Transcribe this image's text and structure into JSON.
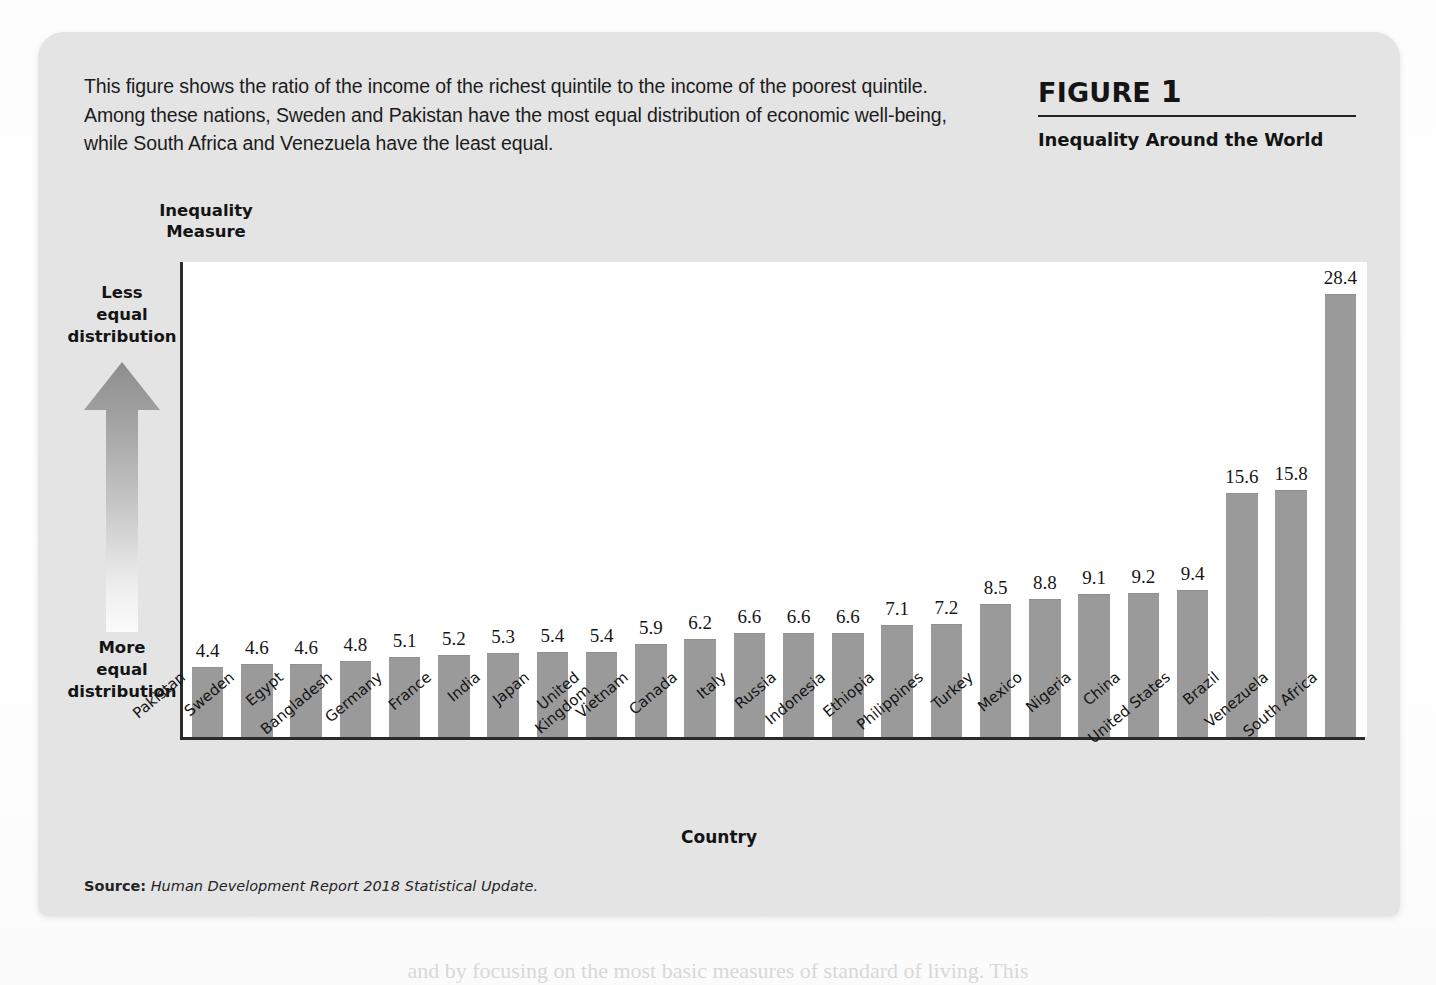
{
  "figure": {
    "intro_text": "This figure shows the ratio of the income of the richest quintile to the income of the poorest quintile. Among these nations, Sweden and Pakistan have the most equal distribution of economic well-being, while South Africa and Venezuela have the least equal.",
    "label_word": "FIGURE",
    "label_number": "1",
    "subtitle": "Inequality Around the World",
    "source_label": "Source:",
    "source_text": "Human Development Report 2018 Statistical Update.",
    "page_bleed_text": "and by focusing on the most basic measures of standard of living. This"
  },
  "annotations": {
    "less_equal": "Less\nequal\ndistribution",
    "more_equal": "More\nequal\ndistribution",
    "arrow_name": "up-arrow-gradient"
  },
  "colors": {
    "bar_fill": "#9a9a9a",
    "card_bg": "#e4e4e4",
    "plot_bg": "#ffffff",
    "axis": "#2b2b2b",
    "arrow_top": "#8f8f8f",
    "arrow_bottom": "#fafafa"
  },
  "chart_data": {
    "type": "bar",
    "title": "Inequality Around the World",
    "xlabel": "Country",
    "ylabel": "Inequality Measure",
    "ylim": [
      0,
      30.5
    ],
    "grid": false,
    "legend": "none",
    "value_labels": true,
    "categories": [
      "Pakistan",
      "Sweden",
      "Egypt",
      "Bangladesh",
      "Germany",
      "France",
      "India",
      "Japan",
      "United\nKingdom",
      "Vietnam",
      "Canada",
      "Italy",
      "Russia",
      "Indonesia",
      "Ethiopia",
      "Philippines",
      "Turkey",
      "Mexico",
      "Nigeria",
      "China",
      "United States",
      "Brazil",
      "Venezuela",
      "South Africa"
    ],
    "values": [
      4.4,
      4.6,
      4.6,
      4.8,
      5.1,
      5.2,
      5.3,
      5.4,
      5.4,
      5.9,
      6.2,
      6.6,
      6.6,
      6.6,
      7.1,
      7.2,
      8.5,
      8.8,
      9.1,
      9.2,
      9.4,
      15.6,
      15.8,
      28.4
    ],
    "value_texts": [
      "4.4",
      "4.6",
      "4.6",
      "4.8",
      "5.1",
      "5.2",
      "5.3",
      "5.4",
      "5.4",
      "5.9",
      "6.2",
      "6.6",
      "6.6",
      "6.6",
      "7.1",
      "7.2",
      "8.5",
      "8.8",
      "9.1",
      "9.2",
      "9.4",
      "15.6",
      "15.8",
      "28.4"
    ]
  }
}
